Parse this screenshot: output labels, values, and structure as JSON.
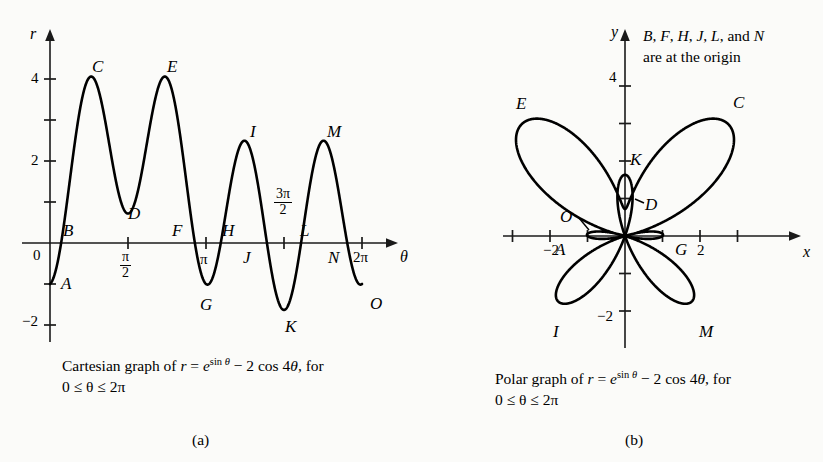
{
  "figure": {
    "background_color": "#fbfbf9",
    "curve_color": "#000000",
    "axis_color": "#1a1a1a"
  },
  "panel_a": {
    "sublabel": "(a)",
    "axis_x_name": "θ",
    "axis_y_name": "r",
    "caption_line1_pre": "Cartesian graph of ",
    "caption_r": "r",
    "caption_eq": " = ",
    "caption_e": "e",
    "caption_exp_sin": "sin ",
    "caption_exp_theta": "θ",
    "caption_rest": " − 2 cos 4",
    "caption_theta2": "θ",
    "caption_comma_for": ", for",
    "caption_line2": "0 ≤  θ ≤ 2π",
    "y_tick_labels": [
      "4",
      "2",
      "0",
      "−2"
    ],
    "x_tick_labels": [
      "π/2",
      "π",
      "3π/2",
      "2π"
    ],
    "point_labels": [
      "A",
      "B",
      "C",
      "D",
      "E",
      "F",
      "G",
      "H",
      "I",
      "J",
      "K",
      "L",
      "M",
      "N",
      "O"
    ]
  },
  "panel_b": {
    "sublabel": "(b)",
    "axis_x_name": "x",
    "axis_y_name": "y",
    "note_line1": "B, F, H, J, L, and N",
    "note_line2": "are at the origin",
    "note_letters": [
      "B",
      "F",
      "H",
      "J",
      "L",
      "N"
    ],
    "caption_line1_pre": "Polar graph of ",
    "caption_r": "r",
    "caption_eq": " = ",
    "caption_e": "e",
    "caption_exp_sin": "sin ",
    "caption_exp_theta": "θ",
    "caption_rest": " − 2 cos 4",
    "caption_theta2": "θ",
    "caption_comma_for": ", for",
    "caption_line2": "0 ≤  θ ≤ 2π",
    "y_tick_labels": [
      "4",
      "−2"
    ],
    "x_tick_labels": [
      "−2",
      "2"
    ],
    "point_labels": [
      "A",
      "C",
      "D",
      "E",
      "G",
      "I",
      "K",
      "M",
      "O"
    ]
  },
  "chart_data": [
    {
      "type": "line",
      "id": "cartesian",
      "title": "Cartesian graph of r = e^(sin theta) - 2 cos 4theta, for 0 <= theta <= 2pi",
      "equation": "r = e^(sin(theta)) - 2*cos(4*theta)",
      "xlabel": "θ",
      "ylabel": "r",
      "xlim": [
        0,
        6.2832
      ],
      "ylim": [
        -2.6,
        4.6
      ],
      "x_ticks": [
        1.5708,
        3.1416,
        4.7124,
        6.2832
      ],
      "x_tick_labels": [
        "π/2",
        "π",
        "3π/2",
        "2π"
      ],
      "y_ticks": [
        -2,
        -1,
        0,
        1,
        2,
        3,
        4
      ],
      "y_tick_labels": [
        "−2",
        "",
        "0",
        "",
        "2",
        "",
        "4"
      ],
      "grid": false,
      "legend": "none",
      "annotations": [
        {
          "label": "A",
          "theta": 0.0,
          "r": -1.0,
          "kind": "endpoint-min"
        },
        {
          "label": "B",
          "theta": 0.3927,
          "r": 0.0,
          "kind": "zero"
        },
        {
          "label": "C",
          "theta": 0.9163,
          "r": 4.1,
          "kind": "max"
        },
        {
          "label": "D",
          "theta": 1.5708,
          "r": 0.718,
          "kind": "local-min"
        },
        {
          "label": "E",
          "theta": 2.2253,
          "r": 4.1,
          "kind": "max"
        },
        {
          "label": "F",
          "theta": 2.7489,
          "r": 0.0,
          "kind": "zero"
        },
        {
          "label": "G",
          "theta": 3.1416,
          "r": -1.0,
          "kind": "local-min"
        },
        {
          "label": "H",
          "theta": 3.5343,
          "r": 0.0,
          "kind": "zero"
        },
        {
          "label": "I",
          "theta": 4.0,
          "r": 2.5,
          "kind": "local-max"
        },
        {
          "label": "J",
          "theta": 4.3197,
          "r": 0.0,
          "kind": "zero"
        },
        {
          "label": "K",
          "theta": 4.7124,
          "r": -1.632,
          "kind": "min"
        },
        {
          "label": "L",
          "theta": 5.1051,
          "r": 0.0,
          "kind": "zero"
        },
        {
          "label": "M",
          "theta": 5.45,
          "r": 2.5,
          "kind": "local-max"
        },
        {
          "label": "N",
          "theta": 5.8905,
          "r": 0.0,
          "kind": "zero"
        },
        {
          "label": "O",
          "theta": 6.2832,
          "r": -1.0,
          "kind": "endpoint-min"
        }
      ]
    },
    {
      "type": "line",
      "id": "polar",
      "title": "Polar graph of r = e^(sin theta) - 2 cos 4theta, for 0 <= theta <= 2pi",
      "equation": "r = e^(sin(theta)) - 2*cos(4*theta)",
      "xlabel": "x",
      "ylabel": "y",
      "xlim": [
        -3.6,
        3.6
      ],
      "ylim": [
        -3.2,
        4.7
      ],
      "x_ticks": [
        -3,
        -2,
        -1,
        1,
        2,
        3
      ],
      "x_tick_labels": [
        "",
        "−2",
        "",
        "",
        "2",
        ""
      ],
      "y_ticks": [
        -2,
        -1,
        1,
        2,
        3,
        4
      ],
      "y_tick_labels": [
        "−2",
        "",
        "",
        "",
        "",
        "4"
      ],
      "grid": false,
      "legend": "none",
      "note": "B, F, H, J, L, and N are at the origin",
      "annotations": [
        {
          "label": "A",
          "theta": 0.0,
          "r": -1.0
        },
        {
          "label": "C",
          "theta": 0.9163,
          "r": 4.1
        },
        {
          "label": "D",
          "theta": 1.5708,
          "r": 0.718
        },
        {
          "label": "E",
          "theta": 2.2253,
          "r": 4.1
        },
        {
          "label": "G",
          "theta": 3.1416,
          "r": -1.0
        },
        {
          "label": "I",
          "theta": 4.0,
          "r": 2.5
        },
        {
          "label": "K",
          "theta": 4.7124,
          "r": -1.632
        },
        {
          "label": "M",
          "theta": 5.45,
          "r": 2.5
        },
        {
          "label": "O",
          "theta": 6.2832,
          "r": -1.0
        }
      ]
    }
  ]
}
